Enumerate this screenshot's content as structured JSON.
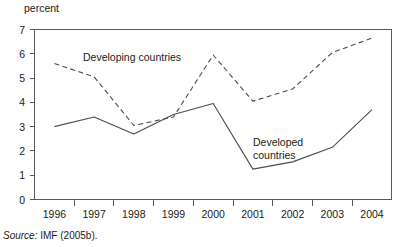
{
  "chart_data": {
    "type": "line",
    "title": "",
    "subtitle": "",
    "ylabel": "percent",
    "xlabel": "",
    "x": [
      1996,
      1997,
      1998,
      1999,
      2000,
      2001,
      2002,
      2003,
      2004
    ],
    "xtick_labels": [
      "1996",
      "1997",
      "1998",
      "1999",
      "2000",
      "2001",
      "2002",
      "2003",
      "2004"
    ],
    "ytick_labels": [
      "0",
      "1",
      "2",
      "3",
      "4",
      "5",
      "6",
      "7"
    ],
    "ylim": [
      0,
      7
    ],
    "ytick_step": 1,
    "grid": false,
    "legend_position": "inline-annotation",
    "series": [
      {
        "name": "Developing countries",
        "style": "dashed",
        "color": "#4c4c4e",
        "values": [
          5.6,
          5.05,
          3.05,
          3.4,
          5.95,
          4.05,
          4.55,
          6.05,
          6.65
        ]
      },
      {
        "name": "Developed countries",
        "style": "solid",
        "color": "#4c4c4e",
        "values": [
          3.0,
          3.4,
          2.7,
          3.5,
          3.95,
          1.25,
          1.55,
          2.15,
          3.7
        ]
      }
    ],
    "annotations": [
      {
        "text": "Developing countries",
        "series": "Developing countries",
        "x": 83,
        "y": 61
      },
      {
        "text": "Developed countries",
        "series": "Developed countries",
        "x": 253,
        "y": 142,
        "lines": [
          "Developed",
          "countries"
        ]
      }
    ]
  },
  "source": {
    "label": "Source:",
    "text": "IMF (2005b)."
  }
}
